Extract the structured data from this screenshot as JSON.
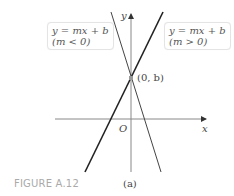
{
  "figure": {
    "caption": "FIGURE A.12",
    "subfigure_label": "(a)"
  },
  "axes": {
    "x_label": "x",
    "y_label": "y",
    "origin_label": "O"
  },
  "point": {
    "label": "(0, b)"
  },
  "lines": [
    {
      "equation": "y = mx + b",
      "condition": "(m < 0)",
      "slope_sign": "negative"
    },
    {
      "equation": "y = mx + b",
      "condition": "(m > 0)",
      "slope_sign": "positive"
    }
  ],
  "colors": {
    "axis": "#888888",
    "line": "#333333",
    "caption": "#aaaaaa"
  }
}
